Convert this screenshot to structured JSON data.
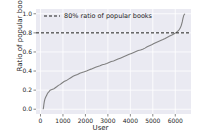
{
  "chart_data": {
    "type": "line",
    "title": "",
    "xlabel": "User",
    "ylabel": "Ratio of popular books",
    "xlim": [
      -200,
      6700
    ],
    "ylim": [
      -0.05,
      1.05
    ],
    "grid": true,
    "legend_position": "upper center",
    "xticks": [
      "0",
      "1000",
      "2000",
      "3000",
      "4000",
      "5000",
      "6000"
    ],
    "xtick_values": [
      0,
      1000,
      2000,
      3000,
      4000,
      5000,
      6000
    ],
    "yticks": [
      "0.0",
      "0.2",
      "0.4",
      "0.6",
      "0.8",
      "1.0"
    ],
    "ytick_values": [
      0.0,
      0.2,
      0.4,
      0.6,
      0.8,
      1.0
    ],
    "series": [
      {
        "name": "ratio-curve",
        "style": "solid",
        "color": "#7f7f7f",
        "x": [
          120,
          135,
          150,
          170,
          190,
          210,
          240,
          270,
          300,
          340,
          380,
          430,
          480,
          540,
          600,
          660,
          720,
          800,
          880,
          960,
          1050,
          1150,
          1250,
          1350,
          1450,
          1550,
          1650,
          1750,
          1850,
          1950,
          2050,
          2150,
          2250,
          2350,
          2450,
          2550,
          2650,
          2750,
          2850,
          2950,
          3050,
          3150,
          3250,
          3350,
          3450,
          3550,
          3650,
          3750,
          3850,
          3950,
          4050,
          4150,
          4250,
          4350,
          4450,
          4550,
          4650,
          4750,
          4850,
          4950,
          5050,
          5150,
          5250,
          5350,
          5450,
          5550,
          5650,
          5750,
          5850,
          5950,
          6050,
          6150,
          6220,
          6270,
          6310,
          6340,
          6380,
          6430
        ],
        "y": [
          0.0,
          0.02,
          0.05,
          0.08,
          0.1,
          0.115,
          0.13,
          0.145,
          0.16,
          0.175,
          0.185,
          0.2,
          0.205,
          0.21,
          0.215,
          0.225,
          0.235,
          0.25,
          0.26,
          0.275,
          0.29,
          0.3,
          0.315,
          0.33,
          0.345,
          0.355,
          0.365,
          0.378,
          0.385,
          0.392,
          0.4,
          0.412,
          0.42,
          0.43,
          0.44,
          0.448,
          0.455,
          0.465,
          0.472,
          0.48,
          0.49,
          0.5,
          0.505,
          0.515,
          0.525,
          0.535,
          0.545,
          0.555,
          0.565,
          0.575,
          0.585,
          0.595,
          0.605,
          0.615,
          0.62,
          0.628,
          0.64,
          0.655,
          0.665,
          0.675,
          0.688,
          0.7,
          0.71,
          0.72,
          0.73,
          0.742,
          0.755,
          0.768,
          0.778,
          0.79,
          0.805,
          0.825,
          0.85,
          0.88,
          0.915,
          0.95,
          0.985,
          1.0
        ]
      },
      {
        "name": "threshold-line",
        "style": "dashed",
        "color": "#1a1a1a",
        "y_constant": 0.8,
        "label": "80% ratio of popular books"
      }
    ],
    "legend": [
      {
        "label": "80% ratio of popular books",
        "style": "dashed",
        "color": "#1a1a1a"
      }
    ],
    "colors": {
      "axes_background": "#eaeaf2",
      "gridline": "#ffffff",
      "curve": "#7f7f7f",
      "threshold": "#1a1a1a",
      "text": "#262626",
      "figure_background": "#ffffff"
    }
  }
}
